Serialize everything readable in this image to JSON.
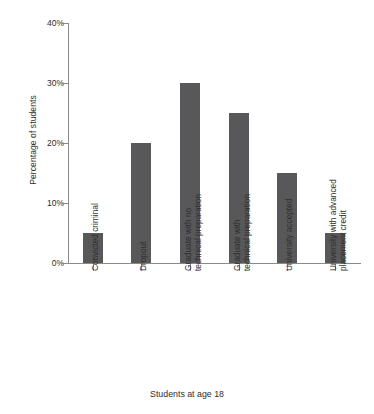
{
  "chart_data": {
    "type": "bar",
    "title": "",
    "xlabel": "Students at age 18",
    "ylabel": "Percentage of students",
    "categories": [
      "Convicted criminal",
      "Dropout",
      "Graduate with no technical preparation",
      "Graduate with technical preparation",
      "University accepted",
      "University with advanced placement credit"
    ],
    "category_lines": [
      [
        "Convicted criminal"
      ],
      [
        "Dropout"
      ],
      [
        "Graduate with no",
        "technical preparation"
      ],
      [
        "Graduate with",
        "technical preparation"
      ],
      [
        "University accepted"
      ],
      [
        "University with advanced",
        "placement credit"
      ]
    ],
    "values": [
      5,
      20,
      30,
      25,
      15,
      5
    ],
    "value_labels": [
      "5%",
      "20%",
      "30%",
      "25%",
      "15%",
      "5%"
    ],
    "ylim": [
      0,
      40
    ],
    "ytick_values": [
      0,
      10,
      20,
      30,
      40
    ],
    "ytick_labels": [
      "0%",
      "10%",
      "20%",
      "30%",
      "40%"
    ],
    "grid": false,
    "legend": null,
    "bar_color": "#58585a",
    "axis_color": "#8a8a8a",
    "background_color": "#ffffff"
  }
}
